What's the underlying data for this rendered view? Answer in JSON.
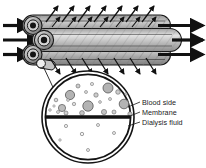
{
  "figure": {
    "name": "hemodialyzer-hollow-fiber-diagram",
    "background_color": "#ffffff",
    "width": 206,
    "height": 168
  },
  "labels": {
    "blood_side": "Blood side",
    "membrane": "Membrane",
    "dialysis_fluid": "Dialysis fluid"
  },
  "colors": {
    "outline": "#1a1a1a",
    "tube_fill_dark": "#8a8a8a",
    "tube_fill_light": "#d8d8d8",
    "tube_fill_mid": "#ababab",
    "arrow": "#111111",
    "membrane_line": "#111111",
    "blood_cell_fill": "#b3b3b3",
    "blood_cell_stroke": "#5a5a5a",
    "dialysis_particle_fill": "#f2f2f2",
    "dialysis_particle_stroke": "#6a6a6a",
    "hatch_line": "#7a7a7a",
    "text": "#1a1a1a"
  },
  "tubes": [
    {
      "id": "tube-top",
      "cy": 25.5,
      "ry": 10.5,
      "x_left": 31,
      "x_right": 168,
      "fill": "dark"
    },
    {
      "id": "tube-middle",
      "cy": 40.0,
      "ry": 11.5,
      "x_left": 40,
      "x_right": 178,
      "fill": "light"
    },
    {
      "id": "tube-bottom",
      "cy": 54.5,
      "ry": 10.5,
      "x_left": 31,
      "x_right": 168,
      "fill": "dark"
    }
  ],
  "inlet_arrows": [
    {
      "id": "inlet-arrow-top",
      "x1": 3,
      "y": 25.5,
      "x2": 30
    },
    {
      "id": "inlet-arrow-middle",
      "x1": 3,
      "y": 40.0,
      "x2": 39
    },
    {
      "id": "inlet-arrow-bottom",
      "x1": 3,
      "y": 54.5,
      "x2": 30
    }
  ],
  "outlet_arrows": [
    {
      "id": "outlet-arrow-top",
      "x1": 160,
      "y": 25.5,
      "x2": 203
    },
    {
      "id": "outlet-arrow-middle",
      "x1": 176,
      "y": 40.0,
      "x2": 203
    },
    {
      "id": "outlet-arrow-bottom",
      "x1": 160,
      "y": 54.5,
      "x2": 203
    }
  ],
  "tube_ports": [
    {
      "id": "port-top",
      "cx": 33,
      "cy": 25.5,
      "r": 8.5
    },
    {
      "id": "port-middle",
      "cx": 44,
      "cy": 40.0,
      "r": 9.0
    },
    {
      "id": "port-bottom",
      "cx": 33,
      "cy": 54.5,
      "r": 8.5
    }
  ],
  "permeate_arrows_up": [
    {
      "x": 54,
      "angle": -55
    },
    {
      "x": 70,
      "angle": -55
    },
    {
      "x": 86,
      "angle": -55
    },
    {
      "x": 102,
      "angle": -55
    },
    {
      "x": 118,
      "angle": -55
    },
    {
      "x": 134,
      "angle": -55
    },
    {
      "x": 150,
      "angle": -55
    }
  ],
  "permeate_arrows_down": [
    {
      "x": 54,
      "angle": 55
    },
    {
      "x": 70,
      "angle": 55
    },
    {
      "x": 86,
      "angle": 55
    },
    {
      "x": 102,
      "angle": 55
    },
    {
      "x": 118,
      "angle": 55
    },
    {
      "x": 134,
      "angle": 55
    },
    {
      "x": 150,
      "angle": 55
    }
  ],
  "cross_section": {
    "cx": 88,
    "cy": 117,
    "r_outer": 46,
    "r_inner": 42.5,
    "membrane_y": 117,
    "membrane_thickness": 3.2,
    "blood_cells": [
      {
        "cx": 70,
        "cy": 95,
        "r": 4.6
      },
      {
        "cx": 108,
        "cy": 88,
        "r": 5.0
      },
      {
        "cx": 88,
        "cy": 106,
        "r": 5.2
      },
      {
        "cx": 124,
        "cy": 104,
        "r": 4.8
      },
      {
        "cx": 62,
        "cy": 108,
        "r": 3.6
      },
      {
        "cx": 96,
        "cy": 95,
        "r": 2.2
      },
      {
        "cx": 78,
        "cy": 86,
        "r": 2.0
      },
      {
        "cx": 118,
        "cy": 92,
        "r": 2.3
      },
      {
        "cx": 56,
        "cy": 100,
        "r": 1.8
      },
      {
        "cx": 82,
        "cy": 113,
        "r": 2.4
      },
      {
        "cx": 104,
        "cy": 112,
        "r": 2.6
      },
      {
        "cx": 66,
        "cy": 113,
        "r": 2.0
      },
      {
        "cx": 130,
        "cy": 114,
        "r": 2.2
      },
      {
        "cx": 114,
        "cy": 112,
        "r": 2.0
      },
      {
        "cx": 92,
        "cy": 84,
        "r": 1.6
      },
      {
        "cx": 58,
        "cy": 112,
        "r": 1.5
      },
      {
        "cx": 74,
        "cy": 104,
        "r": 1.7
      },
      {
        "cx": 100,
        "cy": 102,
        "r": 1.4
      },
      {
        "cx": 136,
        "cy": 108,
        "r": 1.6
      },
      {
        "cx": 50,
        "cy": 110,
        "r": 1.3
      }
    ],
    "dialysis_particles": [
      {
        "cx": 66,
        "cy": 126,
        "r": 1.6
      },
      {
        "cx": 98,
        "cy": 125,
        "r": 1.5
      },
      {
        "cx": 82,
        "cy": 134,
        "r": 1.7
      },
      {
        "cx": 114,
        "cy": 133,
        "r": 1.5
      },
      {
        "cx": 88,
        "cy": 150,
        "r": 1.5
      },
      {
        "cx": 60,
        "cy": 140,
        "r": 1.2
      }
    ]
  },
  "leader_lines": {
    "callout": {
      "x1": 48,
      "y1": 62,
      "x2": 60,
      "y2": 82
    },
    "blood_side": {
      "x1": 130,
      "y1": 106,
      "x2": 140,
      "y2": 103
    },
    "membrane": {
      "x1": 132,
      "y1": 115,
      "x2": 140,
      "y2": 113
    },
    "dialysis_fluid": {
      "x1": 130,
      "y1": 124,
      "x2": 140,
      "y2": 123
    }
  },
  "label_positions": {
    "blood_side": {
      "x": 142,
      "y": 105
    },
    "membrane": {
      "x": 142,
      "y": 115
    },
    "dialysis_fluid": {
      "x": 142,
      "y": 125
    }
  }
}
